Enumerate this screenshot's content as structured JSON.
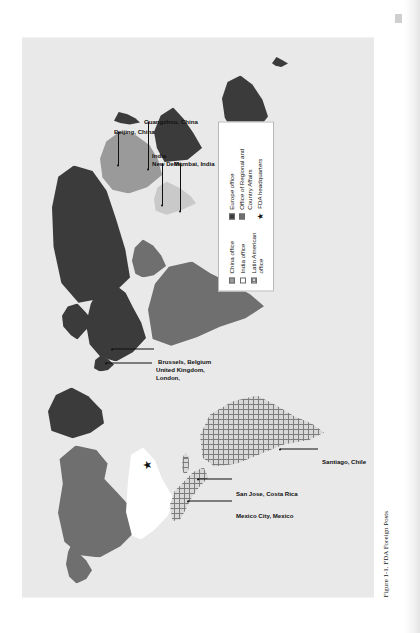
{
  "figure": {
    "caption": "Figure 1-1. FDA Foreign Posts",
    "orientation": "rotated-90-ccw"
  },
  "legend": {
    "columns": [
      {
        "items": [
          {
            "label": "China office",
            "swatch": "solid-gray-square"
          },
          {
            "label": "India office",
            "swatch": "open-white-square"
          },
          {
            "label": "Latin American office",
            "swatch": "hatched-square"
          }
        ]
      },
      {
        "items": [
          {
            "label": "Europe office",
            "swatch": "solid-dark-square"
          },
          {
            "label": "Office of Regional and Country Affairs",
            "swatch": "solid-midgray-square"
          },
          {
            "label": "FDA headquarters",
            "swatch": "black-star"
          }
        ]
      }
    ]
  },
  "map_labels": [
    {
      "id": "beijing",
      "text": "Beijing, China"
    },
    {
      "id": "guangzhou",
      "text": "Guangzhou, China"
    },
    {
      "id": "newdelhi",
      "text": "New Delhi,\nIndia"
    },
    {
      "id": "mumbai",
      "text": "Mumbai, India"
    },
    {
      "id": "london",
      "text": "London,\nUnited Kingdom,"
    },
    {
      "id": "brussels",
      "text": "Brussels, Belgium"
    },
    {
      "id": "mexicocity",
      "text": "Mexico City, Mexico"
    },
    {
      "id": "sanjose",
      "text": "San Jose, Costa Rica"
    },
    {
      "id": "santiago",
      "text": "Santiago, Chile"
    }
  ],
  "map_label_text": {
    "beijing": "Beijing, China",
    "guangzhou": "Guangzhou, China",
    "newdelhi_1": "New Delhi,",
    "newdelhi_2": "India",
    "mumbai": "Mumbai, India",
    "london_1": "London,",
    "london_2": "United Kingdom,",
    "brussels": "Brussels, Belgium",
    "mexicocity": "Mexico City, Mexico",
    "sanjose": "San Jose, Costa Rica",
    "santiago": "Santiago, Chile"
  },
  "colors": {
    "ocean": "#e9e9e9",
    "europe_office": "#3b3b3b",
    "office_regional_country_affairs": "#6f6f6f",
    "china_office": "#9a9a9a",
    "india_office": "#c9c9c9",
    "latin_american_office": "#d8d8d8",
    "usa_unfilled": "#ffffff",
    "text": "#111111"
  },
  "icons": {
    "star": "★"
  }
}
